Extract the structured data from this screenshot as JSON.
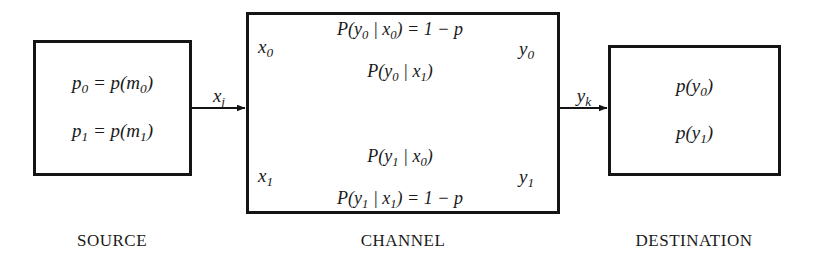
{
  "diagram": {
    "source_box": {
      "lines": [
        {
          "lhs": "p",
          "lhs_sub": "0",
          "rel": " = ",
          "rhs": "p(m",
          "rhs_sub": "0",
          "rhs_tail": ")",
          "text": "p0 = p(m0)"
        },
        {
          "lhs": "p",
          "lhs_sub": "1",
          "rel": " = ",
          "rhs": "p(m",
          "rhs_sub": "1",
          "rhs_tail": ")",
          "text": "p1 = p(m1)"
        }
      ]
    },
    "destination_box": {
      "lines": [
        {
          "head": "p(y",
          "sub": "0",
          "tail": ")",
          "text": "p(y0)"
        },
        {
          "head": "p(y",
          "sub": "1",
          "tail": ")",
          "text": "p(y1)"
        }
      ]
    },
    "channel": {
      "input_nodes": [
        {
          "name": "x",
          "sub": "0",
          "text": "x0"
        },
        {
          "name": "x",
          "sub": "1",
          "text": "x1"
        }
      ],
      "output_nodes": [
        {
          "name": "y",
          "sub": "0",
          "text": "y0"
        },
        {
          "name": "y",
          "sub": "1",
          "text": "y1"
        }
      ],
      "transitions": [
        {
          "id": "y0-given-x0",
          "from": "x0",
          "to": "y0",
          "head": "P(y",
          "sub_out": "0",
          "mid": " | x",
          "sub_in": "0",
          "close": ")",
          "eq": " = 1 − p",
          "text": "P(y0 | x0) = 1 − p",
          "probability": "1 - p"
        },
        {
          "id": "y0-given-x1",
          "from": "x1",
          "to": "y0",
          "head": "P(y",
          "sub_out": "0",
          "mid": " | x",
          "sub_in": "1",
          "close": ")",
          "eq": "",
          "text": "P(y0 | x1)",
          "probability": "p"
        },
        {
          "id": "y1-given-x0",
          "from": "x0",
          "to": "y1",
          "head": "P(y",
          "sub_out": "1",
          "mid": " | x",
          "sub_in": "0",
          "close": ")",
          "eq": "",
          "text": "P(y1 | x0)",
          "probability": "p"
        },
        {
          "id": "y1-given-x1",
          "from": "x1",
          "to": "y1",
          "head": "P(y",
          "sub_out": "1",
          "mid": " | x",
          "sub_in": "1",
          "close": ")",
          "eq": " = 1 − p",
          "text": "P(y1 | x1) = 1 − p",
          "probability": "1 - p"
        }
      ]
    },
    "links": [
      {
        "id": "source-to-channel",
        "head": "x",
        "sub": "j",
        "text": "xj"
      },
      {
        "id": "channel-to-destination",
        "head": "y",
        "sub": "k",
        "text": "yk"
      }
    ],
    "captions": {
      "source": "SOURCE",
      "channel": "CHANNEL",
      "destination": "DESTINATION"
    },
    "colors": {
      "stroke": "#141414",
      "background": "#ffffff",
      "text": "#1a1a1a"
    }
  }
}
